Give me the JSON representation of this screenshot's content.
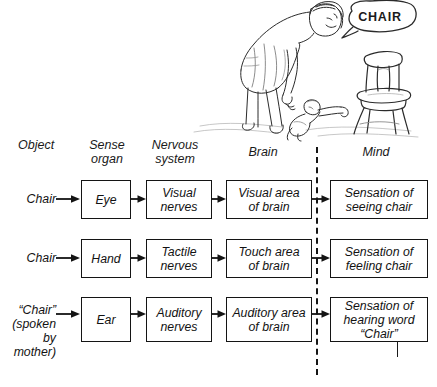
{
  "illustration": {
    "name": "mother-child-chair-sketch",
    "speech_bubble_text": "CHAIR",
    "description": "Pencil sketch of a mother bending over a crawling baby and pointing toward a wooden chair while saying CHAIR"
  },
  "columns": [
    {
      "key": "object",
      "label": "Object"
    },
    {
      "key": "sense",
      "label": "Sense\norgan"
    },
    {
      "key": "nervous",
      "label": "Nervous\nsystem"
    },
    {
      "key": "brain",
      "label": "Brain"
    },
    {
      "key": "mind",
      "label": "Mind"
    }
  ],
  "rows": [
    {
      "source": "Chair",
      "sense_organ": "Eye",
      "nervous_system": "Visual\nnerves",
      "brain": "Visual area\nof brain",
      "mind": "Sensation of\nseeing chair"
    },
    {
      "source": "Chair",
      "sense_organ": "Hand",
      "nervous_system": "Tactile\nnerves",
      "brain": "Touch area\nof brain",
      "mind": "Sensation of\nfeeling chair"
    },
    {
      "source": "“Chair”\n(spoken\nby mother)",
      "sense_organ": "Ear",
      "nervous_system": "Auditory\nnerves",
      "brain": "Auditory area\nof brain",
      "mind": "Sensation of\nhearing word\n“Chair”"
    }
  ],
  "divider": {
    "name": "brain-mind-divider",
    "style": "dashed-vertical"
  },
  "colors": {
    "ink": "#141414",
    "background": "#ffffff"
  }
}
